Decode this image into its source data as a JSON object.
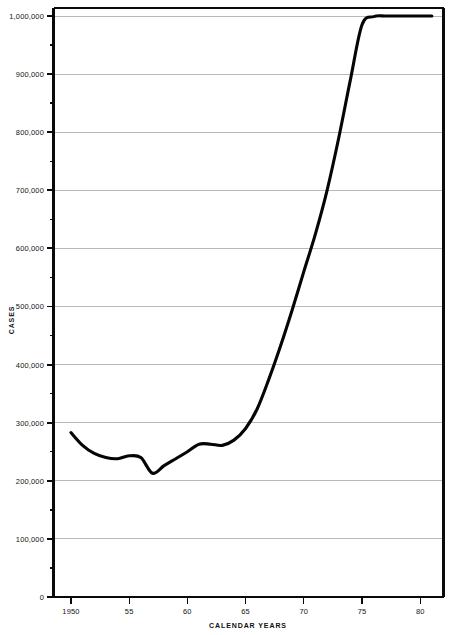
{
  "chart_data": {
    "type": "line",
    "title": "",
    "xlabel": "CALENDAR YEARS",
    "ylabel": "CASES",
    "xlim": [
      1948.5,
      1982.0
    ],
    "ylim": [
      0,
      1000000
    ],
    "grid": true,
    "legend": false,
    "line_color": "#050505",
    "grid_color": "#9a9a9a",
    "axis_color": "#0a0a0a",
    "x_major_ticks": [
      1950,
      1955,
      1960,
      1965,
      1970,
      1975,
      1980
    ],
    "x_tick_labels": [
      "1950",
      "55",
      "60",
      "65",
      "70",
      "75",
      "80"
    ],
    "y_major_ticks": [
      0,
      100000,
      200000,
      300000,
      400000,
      500000,
      600000,
      700000,
      800000,
      900000,
      1000000
    ],
    "y_tick_labels": [
      "0",
      "100,000",
      "200,000",
      "300,000",
      "400,000",
      "500,000",
      "600,000",
      "700,000",
      "800,000",
      "900,000",
      "1,000,000"
    ],
    "y_minor_ticks": [
      50000,
      150000,
      250000,
      350000,
      450000,
      550000,
      650000,
      750000,
      850000,
      950000
    ],
    "x": [
      1950,
      1951,
      1952,
      1953,
      1954,
      1955,
      1956,
      1957,
      1958,
      1959,
      1960,
      1961,
      1962,
      1963,
      1964,
      1965,
      1966,
      1967,
      1968,
      1969,
      1970,
      1971,
      1972,
      1973,
      1974,
      1975,
      1976,
      1977,
      1978,
      1979,
      1980,
      1981
    ],
    "values": [
      283000,
      261000,
      247000,
      240000,
      238000,
      243000,
      240000,
      213000,
      226000,
      238000,
      250000,
      263000,
      263000,
      261000,
      270000,
      290000,
      324000,
      375000,
      432000,
      494000,
      560000,
      625000,
      700000,
      790000,
      890000,
      985000,
      999000,
      1000000,
      1000000,
      1000000,
      1000000,
      1000000
    ],
    "series": [
      {
        "name": "cases",
        "values": [
          283000,
          261000,
          247000,
          240000,
          238000,
          243000,
          240000,
          213000,
          226000,
          238000,
          250000,
          263000,
          263000,
          261000,
          270000,
          290000,
          324000,
          375000,
          432000,
          494000,
          560000,
          625000,
          700000,
          790000,
          890000,
          985000,
          999000,
          1000000,
          1000000,
          1000000,
          1000000,
          1000000
        ]
      }
    ],
    "annotations": []
  }
}
